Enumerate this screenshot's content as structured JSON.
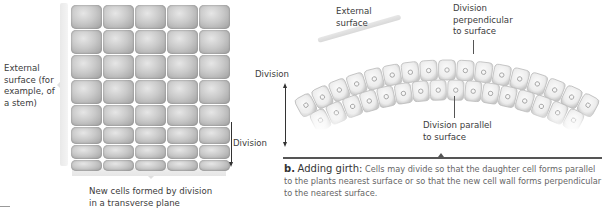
{
  "panel_a": {
    "grid": {
      "columns": 5,
      "rows": 8
    },
    "labels": {
      "external_surface": [
        "External",
        "surface (for",
        "example, of",
        "a stem)"
      ],
      "division": "Division",
      "new_cells": [
        "New cells formed by division",
        "in a transverse plane"
      ]
    },
    "footer_fragment": "T..."
  },
  "panel_b": {
    "labels": {
      "external_surface": [
        "External",
        "surface"
      ],
      "division_perpendicular": [
        "Division",
        "perpendicular",
        "to surface"
      ],
      "division_parallel": [
        "Division parallel",
        "to surface"
      ],
      "division": "Division"
    },
    "caption": {
      "letter": "b.",
      "title": "Adding girth:",
      "text": "Cells may divide so that the daughter cell forms parallel to the plants nearest surface or so that the new cell wall forms perpendicular to the nearest surface."
    }
  },
  "colors": {
    "cell": "#b8b8b8",
    "cell_dark": "#8f8f8f",
    "text": "#3b3b3b",
    "rule": "#555555"
  }
}
